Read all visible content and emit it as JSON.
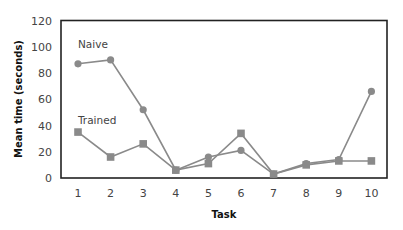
{
  "chart_data": {
    "type": "line",
    "title": "",
    "xlabel": "Task",
    "ylabel": "Mean time (seconds)",
    "x": [
      1,
      2,
      3,
      4,
      5,
      6,
      7,
      8,
      9,
      10
    ],
    "ylim": [
      0,
      120
    ],
    "yticks": [
      0,
      20,
      40,
      60,
      80,
      100,
      120
    ],
    "grid": false,
    "legend": "inline labels",
    "series": [
      {
        "name": "Naive",
        "marker": "circle",
        "values": [
          87,
          90,
          52,
          6,
          16,
          21,
          3,
          11,
          14,
          66
        ]
      },
      {
        "name": "Trained",
        "marker": "square",
        "values": [
          35,
          16,
          26,
          6,
          11,
          34,
          3,
          10,
          13,
          13
        ]
      }
    ]
  },
  "colors": {
    "series": "#8a8a8a",
    "axis": "#222222",
    "text": "#444444"
  }
}
